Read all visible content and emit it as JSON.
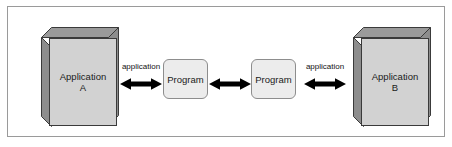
{
  "diagram": {
    "nodes": {
      "app_a": {
        "line1": "Application",
        "line2": "A",
        "shape": "3d-box",
        "fill": "#d2d2d2",
        "side_fill": "#808080",
        "stroke": "#3a3a3a"
      },
      "program_1": {
        "label": "Program",
        "shape": "rounded-rect",
        "fill": "#ececec",
        "stroke": "#8d8d8d"
      },
      "program_2": {
        "label": "Program",
        "shape": "rounded-rect",
        "fill": "#ececec",
        "stroke": "#8d8d8d"
      },
      "app_b": {
        "line1": "Application",
        "line2": "B",
        "shape": "3d-box",
        "fill": "#d2d2d2",
        "side_fill": "#808080",
        "stroke": "#3a3a3a"
      }
    },
    "connectors": [
      {
        "id": "conn_1",
        "label": "application",
        "arrow": "bidirectional",
        "from": "app_a",
        "to": "program_1"
      },
      {
        "id": "conn_2",
        "label": "",
        "arrow": "bidirectional",
        "from": "program_1",
        "to": "program_2"
      },
      {
        "id": "conn_3",
        "label": "application",
        "arrow": "bidirectional",
        "from": "program_2",
        "to": "app_b"
      }
    ],
    "frame": {
      "border_color": "#9a9a9a",
      "background": "#ffffff"
    },
    "arrow_color": "#000000",
    "text_color": "#1a1a1a"
  }
}
